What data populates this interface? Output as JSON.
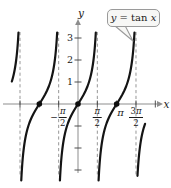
{
  "figure_title": "Graph of the tangent function",
  "callout": {
    "label": "y = tan x",
    "parts": [
      {
        "t": "y",
        "italic": true
      },
      {
        "t": " = ",
        "italic": false
      },
      {
        "t": "tan ",
        "italic": false
      },
      {
        "t": "x",
        "italic": true
      }
    ]
  },
  "axes": {
    "x_label": "x",
    "y_label": "y"
  },
  "y_tick_labels": [
    {
      "value": 3,
      "text": "3"
    },
    {
      "value": 2,
      "text": "2"
    },
    {
      "value": 1,
      "text": "1"
    }
  ],
  "x_axis_labels": [
    {
      "id": "neg-pi-over-2",
      "type": "frac",
      "sign": "−",
      "num": "π",
      "den": "2",
      "pos_half_pi": -1
    },
    {
      "id": "pi-over-2",
      "type": "frac",
      "sign": "",
      "num": "π",
      "den": "2",
      "pos_half_pi": 1
    },
    {
      "id": "pi",
      "type": "plain",
      "text": "π",
      "pos_half_pi": 2.2
    },
    {
      "id": "3-pi-over-2",
      "type": "frac",
      "sign": "",
      "num": "3π",
      "den": "2",
      "pos_half_pi": 3
    }
  ],
  "chart_data": {
    "type": "line",
    "title": "y = tan x",
    "function": "y = tan(x)",
    "period": "π",
    "xlabel": "x",
    "ylabel": "y",
    "x_domain_shown": "approximately -2π to 2π",
    "y_clip": [
      -3.5,
      3.25
    ],
    "y_ticks_labeled": [
      1,
      2,
      3
    ],
    "y_ticks_unlabeled": [
      -1,
      -2,
      -3
    ],
    "x_ticks_half_pi": [
      -3,
      -2,
      -1,
      1,
      2,
      3,
      4
    ],
    "x_tick_labels_shown": [
      "-π/2",
      "π/2",
      "π",
      "3π/2"
    ],
    "asymptotes_half_pi": [
      -3,
      -1,
      1,
      3
    ],
    "asymptote_values": [
      "-3π/2",
      "-π/2",
      "π/2",
      "3π/2"
    ],
    "zeros_marked_half_pi": [
      -2,
      0,
      2
    ],
    "zeros_marked_values": [
      "-π",
      "0",
      "π"
    ],
    "visible_branches": [
      {
        "center_half_pi": -4,
        "center": "-2π",
        "v_from": 1.0,
        "v_to": 3.25,
        "note": "partial, upper part only"
      },
      {
        "center_half_pi": -2,
        "center": "-π",
        "v_from": -3.5,
        "v_to": 3.25
      },
      {
        "center_half_pi": 0,
        "center": "0",
        "v_from": -3.5,
        "v_to": 3.25
      },
      {
        "center_half_pi": 2,
        "center": "π",
        "v_from": -3.5,
        "v_to": 3.25
      },
      {
        "center_half_pi": 4,
        "center": "2π",
        "v_from": -3.3,
        "v_to": -0.9,
        "note": "partial, lower part only"
      }
    ],
    "key_points": [
      {
        "x": "-π",
        "y": 0
      },
      {
        "x": "0",
        "y": 0
      },
      {
        "x": "π",
        "y": 0
      },
      {
        "x": "-3π/4",
        "y": 1
      },
      {
        "x": "π/4",
        "y": 1
      },
      {
        "x": "-π/4",
        "y": -1
      }
    ],
    "grid": false,
    "legend": "callout box pointing to branch centered at π"
  },
  "colors": {
    "background": "#ffffff",
    "curve": "#141414",
    "axis": "#8d8d8d",
    "tick": "#3c3c3c",
    "asymptote_dash": "#979797",
    "text": "#1a1a1a",
    "callout_bg": "#f7f7f5",
    "callout_border": "#9a9a9a",
    "dot": "#0d0d0d"
  }
}
